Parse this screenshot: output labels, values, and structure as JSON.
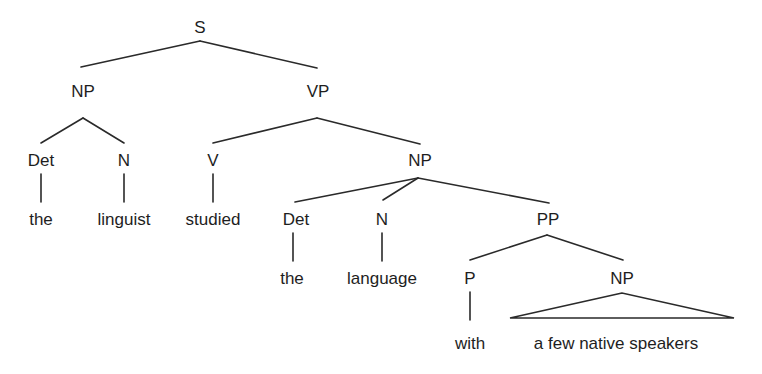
{
  "diagram": {
    "type": "syntax-tree",
    "sentence": "the linguist studied the language with a few native speakers",
    "nodes": {
      "s": {
        "label": "S",
        "x": 200,
        "y": 27
      },
      "np1": {
        "label": "NP",
        "x": 83,
        "y": 91
      },
      "vp": {
        "label": "VP",
        "x": 318,
        "y": 91
      },
      "det1": {
        "label": "Det",
        "x": 41,
        "y": 160
      },
      "n1": {
        "label": "N",
        "x": 124,
        "y": 160
      },
      "v": {
        "label": "V",
        "x": 213,
        "y": 160
      },
      "np2": {
        "label": "NP",
        "x": 420,
        "y": 160
      },
      "the1": {
        "label": "the",
        "x": 41,
        "y": 219
      },
      "linguist": {
        "label": "linguist",
        "x": 124,
        "y": 219
      },
      "studied": {
        "label": "studied",
        "x": 213,
        "y": 219
      },
      "det2": {
        "label": "Det",
        "x": 296,
        "y": 219
      },
      "n2": {
        "label": "N",
        "x": 382,
        "y": 219
      },
      "pp": {
        "label": "PP",
        "x": 548,
        "y": 219
      },
      "the2": {
        "label": "the",
        "x": 292,
        "y": 278
      },
      "language": {
        "label": "language",
        "x": 382,
        "y": 278
      },
      "p": {
        "label": "P",
        "x": 470,
        "y": 278
      },
      "np3": {
        "label": "NP",
        "x": 622,
        "y": 278
      },
      "with": {
        "label": "with",
        "x": 470,
        "y": 343
      },
      "speakers": {
        "label": "a few native speakers",
        "x": 616,
        "y": 343
      }
    },
    "edges": [
      {
        "from": "s",
        "to": "np1",
        "x1": 200,
        "y1": 41,
        "x2": 81,
        "y2": 67
      },
      {
        "from": "s",
        "to": "vp",
        "x1": 200,
        "y1": 41,
        "x2": 317,
        "y2": 68
      },
      {
        "from": "np1",
        "to": "det1",
        "x1": 83,
        "y1": 118,
        "x2": 41,
        "y2": 143
      },
      {
        "from": "np1",
        "to": "n1",
        "x1": 83,
        "y1": 118,
        "x2": 124,
        "y2": 143
      },
      {
        "from": "vp",
        "to": "v",
        "x1": 317,
        "y1": 118,
        "x2": 213,
        "y2": 143
      },
      {
        "from": "vp",
        "to": "np2",
        "x1": 317,
        "y1": 118,
        "x2": 420,
        "y2": 144
      },
      {
        "from": "det1",
        "to": "the1",
        "x1": 41,
        "y1": 174,
        "x2": 41,
        "y2": 202
      },
      {
        "from": "n1",
        "to": "linguist",
        "x1": 124,
        "y1": 174,
        "x2": 124,
        "y2": 202
      },
      {
        "from": "v",
        "to": "studied",
        "x1": 213,
        "y1": 174,
        "x2": 213,
        "y2": 202
      },
      {
        "from": "np2",
        "to": "det2",
        "x1": 418,
        "y1": 178,
        "x2": 295,
        "y2": 202
      },
      {
        "from": "np2",
        "to": "n2",
        "x1": 418,
        "y1": 178,
        "x2": 383,
        "y2": 200
      },
      {
        "from": "np2",
        "to": "pp",
        "x1": 418,
        "y1": 178,
        "x2": 549,
        "y2": 203
      },
      {
        "from": "det2",
        "to": "the2",
        "x1": 293,
        "y1": 233,
        "x2": 293,
        "y2": 261
      },
      {
        "from": "n2",
        "to": "language",
        "x1": 382,
        "y1": 233,
        "x2": 382,
        "y2": 261
      },
      {
        "from": "pp",
        "to": "p",
        "x1": 547,
        "y1": 235,
        "x2": 470,
        "y2": 260
      },
      {
        "from": "pp",
        "to": "np3",
        "x1": 547,
        "y1": 235,
        "x2": 623,
        "y2": 260
      },
      {
        "from": "p",
        "to": "with",
        "x1": 470,
        "y1": 292,
        "x2": 470,
        "y2": 320
      }
    ],
    "triangle": {
      "over": "np3",
      "apex_x": 622,
      "apex_y": 293,
      "left_x": 510,
      "right_x": 734,
      "base_y": 318,
      "points": "622,293 510,318 734,318"
    },
    "colors": {
      "line": "#2a2a2a",
      "text": "#1e1e1e",
      "background": "#ffffff"
    }
  }
}
